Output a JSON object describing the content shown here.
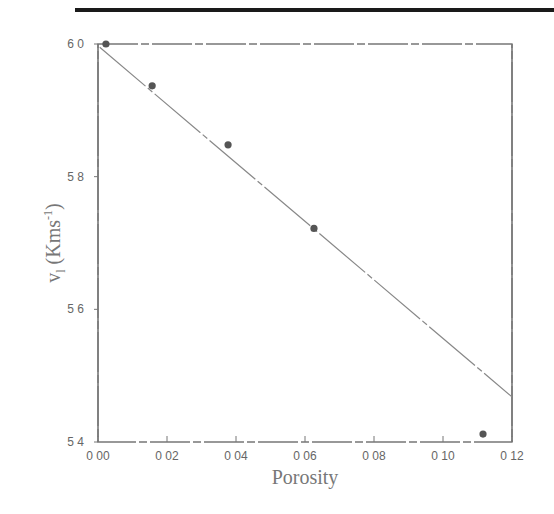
{
  "chart_data": {
    "type": "scatter",
    "title": "",
    "xlabel": "Porosity",
    "ylabel": "v_l (Kms^-1)",
    "ylabel_parts": {
      "main": "v",
      "sub": "l",
      "unit_open": "(Kms",
      "unit_sup": "-1",
      "unit_close": ")"
    },
    "xlim": [
      0.0,
      0.12
    ],
    "ylim": [
      5.4,
      6.0
    ],
    "x_ticks": [
      0.0,
      0.02,
      0.04,
      0.06,
      0.08,
      0.1,
      0.12
    ],
    "x_tick_labels": [
      "0 00",
      "0 02",
      "0 04",
      "0 06",
      "0 08",
      "0 10",
      "0 12"
    ],
    "y_ticks": [
      5.4,
      5.6,
      5.8,
      6.0
    ],
    "y_tick_labels": [
      "5 4",
      "5 6",
      "5 8",
      "6 0"
    ],
    "grid": false,
    "legend": null,
    "series": [
      {
        "name": "measured",
        "kind": "points",
        "x": [
          0.0023,
          0.0157,
          0.0377,
          0.0626,
          0.1116
        ],
        "y": [
          6.0,
          5.937,
          5.848,
          5.722,
          5.412
        ]
      },
      {
        "name": "linear fit",
        "kind": "line",
        "x": [
          0.0005,
          0.12
        ],
        "y": [
          5.995,
          5.468
        ]
      }
    ]
  },
  "colors": {
    "axis": "#777777",
    "points": "#555555",
    "fit_line": "#888888",
    "top_rule": "#1a1a1a"
  }
}
